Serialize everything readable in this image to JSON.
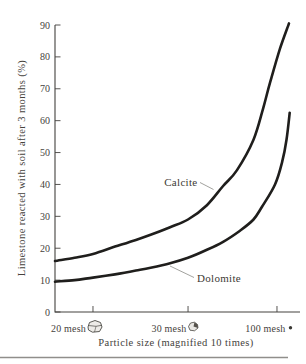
{
  "chart_data": {
    "type": "line",
    "title": "",
    "xlabel": "Particle size (magnified 10 times)",
    "ylabel": "Limestone reacted with soil after 3 months (%)",
    "ylim": [
      0,
      90
    ],
    "y_ticks": [
      0,
      10,
      20,
      30,
      40,
      50,
      60,
      70,
      80,
      90
    ],
    "x_ticks": [
      {
        "label": "20 mesh",
        "icon": "large-particle",
        "pos": 0.155
      },
      {
        "label": "30 mesh",
        "icon": "medium-particle",
        "pos": 0.543
      },
      {
        "label": "100 mesh",
        "icon": "tiny-particle-dot",
        "pos": 0.906
      }
    ],
    "grid": false,
    "legend": "inline-curve-labels",
    "series": [
      {
        "name": "Calcite",
        "points_format": "[position_along_x_axis_0to1, percent_reacted]",
        "points": [
          [
            0.0,
            16
          ],
          [
            0.08,
            17
          ],
          [
            0.155,
            18.2
          ],
          [
            0.245,
            20.5
          ],
          [
            0.33,
            22.6
          ],
          [
            0.39,
            24.2
          ],
          [
            0.47,
            26.6
          ],
          [
            0.543,
            29
          ],
          [
            0.62,
            33.5
          ],
          [
            0.686,
            39.5
          ],
          [
            0.743,
            44.5
          ],
          [
            0.81,
            54
          ],
          [
            0.85,
            64
          ],
          [
            0.878,
            72
          ],
          [
            0.918,
            82.5
          ],
          [
            0.955,
            90.5
          ]
        ]
      },
      {
        "name": "Dolomite",
        "points_format": "[position_along_x_axis_0to1, percent_reacted]",
        "points": [
          [
            0.0,
            9.5
          ],
          [
            0.08,
            10
          ],
          [
            0.155,
            10.8
          ],
          [
            0.245,
            11.8
          ],
          [
            0.33,
            13
          ],
          [
            0.39,
            13.9
          ],
          [
            0.47,
            15.3
          ],
          [
            0.543,
            17
          ],
          [
            0.62,
            19.5
          ],
          [
            0.686,
            22
          ],
          [
            0.755,
            25.5
          ],
          [
            0.81,
            29
          ],
          [
            0.845,
            33
          ],
          [
            0.898,
            40
          ],
          [
            0.927,
            47
          ],
          [
            0.945,
            54
          ],
          [
            0.958,
            62.5
          ]
        ]
      }
    ],
    "annotations": [
      {
        "text": "Calcite",
        "points_to": "upper curve"
      },
      {
        "text": "Dolomite",
        "points_to": "lower curve"
      }
    ]
  },
  "colors": {
    "curve": "#1f1e1c",
    "axis": "#44423e",
    "text": "#45423c",
    "leader_line": "#8a8a85",
    "bottom_rule": "#908e8b",
    "background": "#ffffff"
  }
}
